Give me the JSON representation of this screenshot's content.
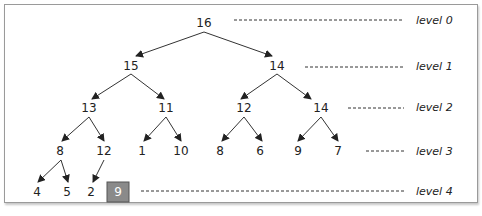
{
  "diagram": {
    "levels": [
      "level 0",
      "level 1",
      "level 2",
      "level 3",
      "level 4"
    ],
    "nodes": {
      "n0": "16",
      "n1": "15",
      "n2": "14",
      "n3": "13",
      "n4": "11",
      "n5": "12",
      "n6": "14",
      "n7": "8",
      "n8": "12",
      "n9": "1",
      "n10": "10",
      "n11": "8",
      "n12": "6",
      "n13": "9",
      "n14": "7",
      "n15": "4",
      "n16": "5",
      "n17": "2",
      "n18": "9"
    },
    "highlighted_node": "n18",
    "highlight_color": "#8a8a8a"
  }
}
